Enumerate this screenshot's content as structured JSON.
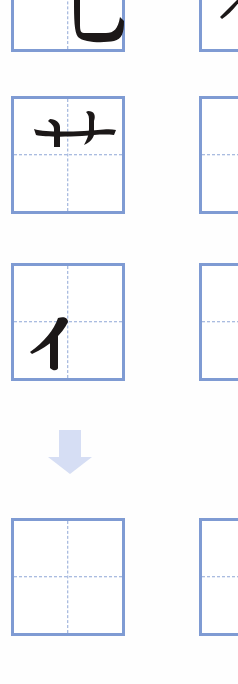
{
  "worksheet": {
    "rows": [
      {
        "left": {
          "stroke": "乚 (partial, bottom of hook)",
          "show_guides": true
        },
        "right": {
          "stroke": "partial stroke (cut off)",
          "show_guides": false
        }
      },
      {
        "left": {
          "stroke": "艹",
          "show_guides": true
        },
        "right": {
          "stroke": "",
          "show_guides": true
        }
      },
      {
        "left": {
          "stroke": "亻",
          "show_guides": true
        },
        "right": {
          "stroke": "",
          "show_guides": true
        }
      },
      {
        "left": {
          "stroke": "",
          "show_guides": true
        },
        "right": {
          "stroke": "",
          "show_guides": true
        }
      }
    ],
    "arrow": {
      "icon": "down-arrow-icon",
      "color": "#d6def4"
    },
    "colors": {
      "box_border": "#7f9bd3",
      "guide": "#8ea6d6",
      "ink": "#1c1818"
    }
  }
}
